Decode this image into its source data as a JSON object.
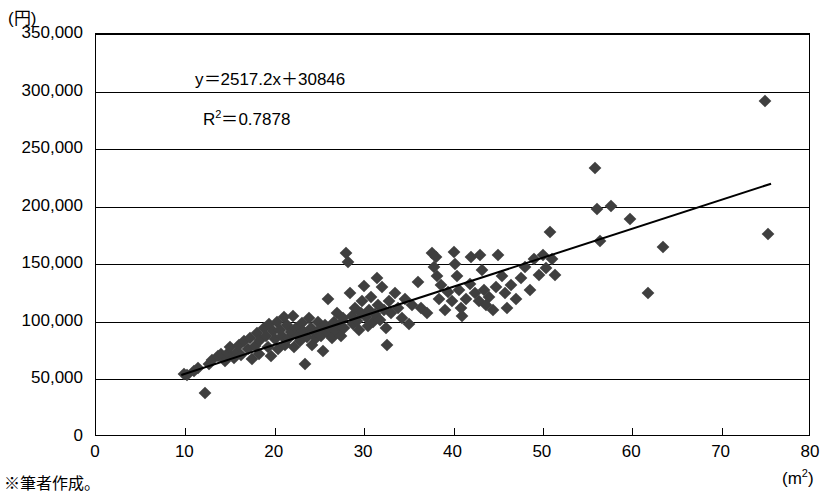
{
  "footnote": "※筆者作成。",
  "axis": {
    "y_unit": "(円)",
    "x_unit_main": "(m",
    "x_unit_sup": "2",
    "x_unit_close": ")"
  },
  "annotations": {
    "equation": "y＝2517.2x＋30846",
    "r_squared_prefix": "R",
    "r_squared_sup": "2",
    "r_squared_value": "＝0.7878"
  },
  "chart_data": {
    "type": "scatter",
    "title": "",
    "xlabel": "(m2)",
    "ylabel": "(円)",
    "xlim": [
      0,
      80
    ],
    "ylim": [
      0,
      350000
    ],
    "xticks": [
      0,
      10,
      20,
      30,
      40,
      50,
      60,
      70,
      80
    ],
    "xtick_labels": [
      "0",
      "10",
      "20",
      "30",
      "40",
      "50",
      "60",
      "70",
      "80"
    ],
    "yticks": [
      0,
      50000,
      100000,
      150000,
      200000,
      250000,
      300000,
      350000
    ],
    "ytick_labels": [
      "0",
      "50,000",
      "100,000",
      "150,000",
      "200,000",
      "250,000",
      "300,000",
      "350,000"
    ],
    "grid": "horizontal",
    "legend": "none",
    "marker": "diamond",
    "marker_color": "#3f3f3f",
    "trendline": {
      "type": "linear",
      "equation": "y=2517.2x+30846",
      "slope": 2517.2,
      "intercept": 30846,
      "r_squared": 0.7878,
      "x_start": 9.5,
      "x_end": 75.5,
      "color": "#000000"
    },
    "points": [
      [
        9.8,
        55000
      ],
      [
        10.2,
        54000
      ],
      [
        11.0,
        57000
      ],
      [
        11.4,
        60000
      ],
      [
        12.2,
        38000
      ],
      [
        12.6,
        63000
      ],
      [
        13.0,
        67000
      ],
      [
        13.6,
        70000
      ],
      [
        14.0,
        72000
      ],
      [
        14.4,
        66000
      ],
      [
        14.8,
        73000
      ],
      [
        15.0,
        78000
      ],
      [
        15.4,
        69000
      ],
      [
        15.8,
        74000
      ],
      [
        16.0,
        80000
      ],
      [
        16.2,
        71000
      ],
      [
        16.6,
        83000
      ],
      [
        17.0,
        76000
      ],
      [
        17.2,
        86000
      ],
      [
        17.4,
        68000
      ],
      [
        17.8,
        79000
      ],
      [
        18.0,
        90000
      ],
      [
        18.2,
        72000
      ],
      [
        18.4,
        84000
      ],
      [
        18.8,
        95000
      ],
      [
        19.0,
        88000
      ],
      [
        19.2,
        78000
      ],
      [
        19.4,
        98000
      ],
      [
        19.6,
        70000
      ],
      [
        19.8,
        92000
      ],
      [
        20.0,
        85000
      ],
      [
        20.2,
        100000
      ],
      [
        20.4,
        76000
      ],
      [
        20.6,
        93000
      ],
      [
        20.8,
        88000
      ],
      [
        21.0,
        104000
      ],
      [
        21.2,
        80000
      ],
      [
        21.4,
        97000
      ],
      [
        21.6,
        86000
      ],
      [
        21.8,
        91000
      ],
      [
        22.0,
        105000
      ],
      [
        22.2,
        78000
      ],
      [
        22.4,
        95000
      ],
      [
        22.6,
        88000
      ],
      [
        22.8,
        83000
      ],
      [
        23.0,
        99000
      ],
      [
        23.2,
        92000
      ],
      [
        23.4,
        63000
      ],
      [
        23.6,
        87000
      ],
      [
        23.8,
        103000
      ],
      [
        24.0,
        95000
      ],
      [
        24.2,
        80000
      ],
      [
        24.4,
        91000
      ],
      [
        24.6,
        86000
      ],
      [
        24.8,
        100000
      ],
      [
        25.0,
        93000
      ],
      [
        25.2,
        88000
      ],
      [
        25.4,
        75000
      ],
      [
        25.6,
        97000
      ],
      [
        25.8,
        91000
      ],
      [
        26.0,
        120000
      ],
      [
        26.2,
        94000
      ],
      [
        26.4,
        86000
      ],
      [
        26.6,
        100000
      ],
      [
        26.8,
        92000
      ],
      [
        27.0,
        108000
      ],
      [
        27.2,
        97000
      ],
      [
        27.4,
        88000
      ],
      [
        27.6,
        103000
      ],
      [
        27.8,
        95000
      ],
      [
        28.0,
        160000
      ],
      [
        28.2,
        152000
      ],
      [
        28.4,
        125000
      ],
      [
        28.6,
        105000
      ],
      [
        28.8,
        98000
      ],
      [
        29.0,
        112000
      ],
      [
        29.2,
        101000
      ],
      [
        29.4,
        93000
      ],
      [
        29.6,
        108000
      ],
      [
        29.8,
        118000
      ],
      [
        30.0,
        131000
      ],
      [
        30.2,
        104000
      ],
      [
        30.4,
        96000
      ],
      [
        30.6,
        110000
      ],
      [
        30.8,
        122000
      ],
      [
        31.0,
        100000
      ],
      [
        31.2,
        107000
      ],
      [
        31.4,
        138000
      ],
      [
        31.6,
        115000
      ],
      [
        31.8,
        102000
      ],
      [
        32.0,
        130000
      ],
      [
        32.2,
        110000
      ],
      [
        32.4,
        95000
      ],
      [
        32.6,
        80000
      ],
      [
        32.8,
        118000
      ],
      [
        33.0,
        108000
      ],
      [
        33.4,
        125000
      ],
      [
        33.8,
        112000
      ],
      [
        34.2,
        103000
      ],
      [
        34.6,
        120000
      ],
      [
        35.0,
        98000
      ],
      [
        35.4,
        115000
      ],
      [
        36.0,
        135000
      ],
      [
        36.4,
        112000
      ],
      [
        37.0,
        108000
      ],
      [
        37.6,
        160000
      ],
      [
        37.8,
        148000
      ],
      [
        38.0,
        156000
      ],
      [
        38.2,
        140000
      ],
      [
        38.4,
        120000
      ],
      [
        38.6,
        132000
      ],
      [
        39.0,
        110000
      ],
      [
        39.4,
        126000
      ],
      [
        39.8,
        118000
      ],
      [
        40.0,
        161000
      ],
      [
        40.2,
        150000
      ],
      [
        40.4,
        140000
      ],
      [
        40.6,
        128000
      ],
      [
        40.8,
        112000
      ],
      [
        41.0,
        105000
      ],
      [
        41.4,
        120000
      ],
      [
        41.8,
        133000
      ],
      [
        42.0,
        156000
      ],
      [
        42.4,
        125000
      ],
      [
        42.8,
        118000
      ],
      [
        43.0,
        158000
      ],
      [
        43.2,
        145000
      ],
      [
        43.4,
        128000
      ],
      [
        43.6,
        115000
      ],
      [
        44.0,
        122000
      ],
      [
        44.4,
        110000
      ],
      [
        44.8,
        130000
      ],
      [
        45.0,
        158000
      ],
      [
        45.4,
        140000
      ],
      [
        45.8,
        125000
      ],
      [
        46.0,
        112000
      ],
      [
        46.4,
        132000
      ],
      [
        47.0,
        120000
      ],
      [
        47.6,
        138000
      ],
      [
        48.0,
        148000
      ],
      [
        48.6,
        128000
      ],
      [
        49.0,
        155000
      ],
      [
        49.6,
        141000
      ],
      [
        50.0,
        158000
      ],
      [
        50.4,
        147000
      ],
      [
        50.8,
        178000
      ],
      [
        51.0,
        155000
      ],
      [
        51.4,
        141000
      ],
      [
        55.8,
        234000
      ],
      [
        56.0,
        198000
      ],
      [
        56.4,
        170000
      ],
      [
        57.6,
        201000
      ],
      [
        59.8,
        189000
      ],
      [
        61.8,
        125000
      ],
      [
        63.4,
        165000
      ],
      [
        74.8,
        292000
      ],
      [
        75.2,
        176000
      ]
    ]
  }
}
